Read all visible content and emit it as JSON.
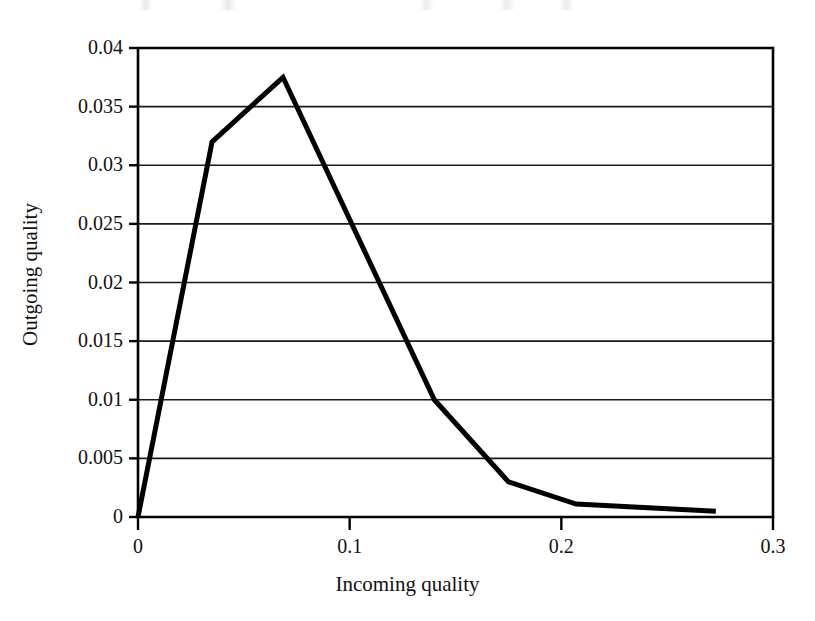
{
  "chart_data": {
    "type": "line",
    "title": "",
    "xlabel": "Incoming quality",
    "ylabel": "Outgoing quality",
    "xlim": [
      0,
      0.3
    ],
    "ylim": [
      0,
      0.04
    ],
    "xticks": [
      "0",
      "0.1",
      "0.2",
      "0.3"
    ],
    "xtick_values": [
      0,
      0.1,
      0.2,
      0.3
    ],
    "yticks": [
      "0",
      "0.005",
      "0.01",
      "0.015",
      "0.02",
      "0.025",
      "0.03",
      "0.035",
      "0.04"
    ],
    "ytick_values": [
      0,
      0.005,
      0.01,
      0.015,
      0.02,
      0.025,
      0.03,
      0.035,
      0.04
    ],
    "grid": "horizontal",
    "legend": "none",
    "series": [
      {
        "name": "Average outgoing quality",
        "color": "#000000",
        "x": [
          0,
          0.035,
          0.0685,
          0.14,
          0.175,
          0.207,
          0.273
        ],
        "y": [
          0,
          0.032,
          0.0375,
          0.01,
          0.003,
          0.0011,
          0.0005
        ]
      }
    ]
  },
  "axes": {
    "x_title": "Incoming quality",
    "y_title": "Outgoing quality"
  }
}
